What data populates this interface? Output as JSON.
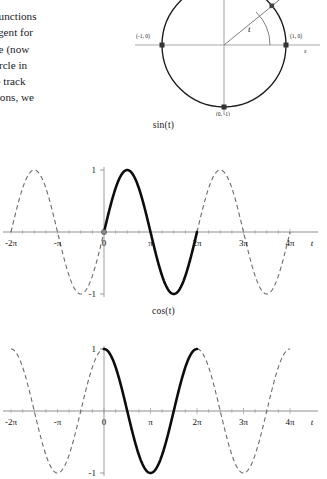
{
  "prose": {
    "lines": [
      "riodic functions",
      "ave tangent for",
      "he angle (now",
      "d the circle in",
      "n.  If we track",
      "e functions, we"
    ]
  },
  "circle_figure": {
    "name": "unit-circle-diagram",
    "labels": {
      "left_point": "(-1, 0)",
      "right_point": "(1, 0)",
      "bottom_point": "(0, -1)",
      "x_axis": "x",
      "angle": "t"
    },
    "colors": {
      "circle": "#1a1a1a",
      "axis": "#9a9a9a",
      "ray": "#7a7a7a"
    }
  },
  "chart_data": [
    {
      "type": "line",
      "name": "sin-plot",
      "title": "sin(t)",
      "function": "sin",
      "xlabel": "t",
      "ylabel": "",
      "xlim": [
        -6.2831853,
        12.5663706
      ],
      "ylim": [
        -1,
        1
      ],
      "grid": false,
      "legend": null,
      "xtick_labels": [
        "-2π",
        "-π",
        "0",
        "π",
        "2π",
        "3π",
        "4π"
      ],
      "xtick_values": [
        -6.2831853,
        -3.1415927,
        0,
        3.1415927,
        6.2831853,
        9.424778,
        12.5663706
      ],
      "ytick_labels": [
        "1",
        "-1"
      ],
      "ytick_values": [
        1,
        -1
      ],
      "highlight_range": [
        0,
        6.2831853
      ],
      "highlight_style": "solid",
      "outside_style": "dashed",
      "marked_point": {
        "x": 0,
        "y": 0
      },
      "key_points": [
        {
          "x": -6.2831853,
          "y": 0
        },
        {
          "x": -4.712389,
          "y": 1
        },
        {
          "x": -3.1415927,
          "y": 0
        },
        {
          "x": -1.5707963,
          "y": -1
        },
        {
          "x": 0,
          "y": 0
        },
        {
          "x": 1.5707963,
          "y": 1
        },
        {
          "x": 3.1415927,
          "y": 0
        },
        {
          "x": 4.712389,
          "y": -1
        },
        {
          "x": 6.2831853,
          "y": 0
        },
        {
          "x": 7.8539816,
          "y": 1
        },
        {
          "x": 9.424778,
          "y": 0
        },
        {
          "x": 10.9955743,
          "y": -1
        },
        {
          "x": 12.5663706,
          "y": 0
        }
      ]
    },
    {
      "type": "line",
      "name": "cos-plot",
      "title": "cos(t)",
      "function": "cos",
      "xlabel": "t",
      "ylabel": "",
      "xlim": [
        -6.2831853,
        12.5663706
      ],
      "ylim": [
        -1,
        1
      ],
      "grid": false,
      "legend": null,
      "xtick_labels": [
        "-2π",
        "-π",
        "0",
        "π",
        "2π",
        "3π",
        "4π"
      ],
      "xtick_values": [
        -6.2831853,
        -3.1415927,
        0,
        3.1415927,
        6.2831853,
        9.424778,
        12.5663706
      ],
      "ytick_labels": [
        "1",
        "-1"
      ],
      "ytick_values": [
        1,
        -1
      ],
      "highlight_range": [
        0,
        6.2831853
      ],
      "highlight_style": "solid",
      "outside_style": "dashed",
      "key_points": [
        {
          "x": -6.2831853,
          "y": 1
        },
        {
          "x": -4.712389,
          "y": 0
        },
        {
          "x": -3.1415927,
          "y": -1
        },
        {
          "x": -1.5707963,
          "y": 0
        },
        {
          "x": 0,
          "y": 1
        },
        {
          "x": 1.5707963,
          "y": 0
        },
        {
          "x": 3.1415927,
          "y": -1
        },
        {
          "x": 4.712389,
          "y": 0
        },
        {
          "x": 6.2831853,
          "y": 1
        },
        {
          "x": 7.8539816,
          "y": 0
        },
        {
          "x": 9.424778,
          "y": -1
        },
        {
          "x": 10.9955743,
          "y": 0
        },
        {
          "x": 12.5663706,
          "y": 1
        }
      ]
    }
  ]
}
